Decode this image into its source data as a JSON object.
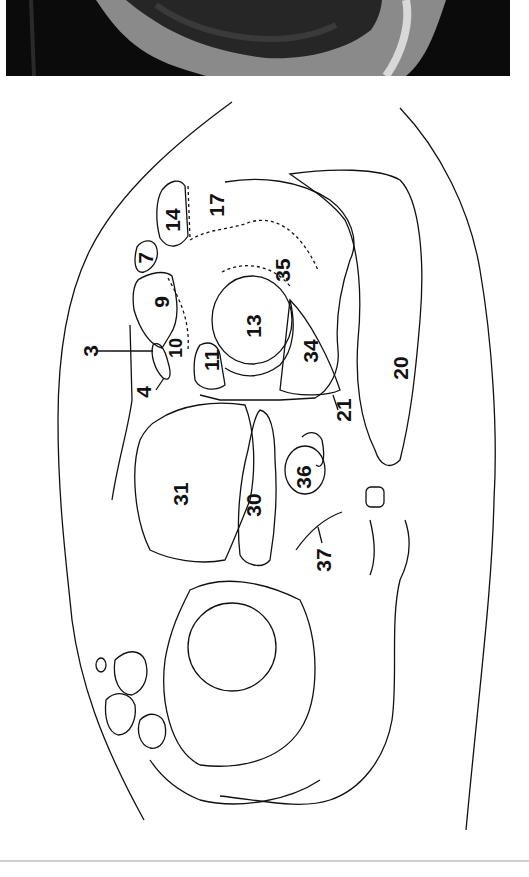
{
  "figure": {
    "type": "cross-sectional anatomy diagram",
    "image_panel": "MRI slice (grayscale)",
    "labels": [
      {
        "id": "3",
        "text": "3"
      },
      {
        "id": "4",
        "text": "4"
      },
      {
        "id": "7",
        "text": "7"
      },
      {
        "id": "9",
        "text": "9"
      },
      {
        "id": "10",
        "text": "10"
      },
      {
        "id": "11",
        "text": "11"
      },
      {
        "id": "13",
        "text": "13"
      },
      {
        "id": "14",
        "text": "14"
      },
      {
        "id": "17",
        "text": "17"
      },
      {
        "id": "20",
        "text": "20"
      },
      {
        "id": "21",
        "text": "21"
      },
      {
        "id": "30",
        "text": "30"
      },
      {
        "id": "31",
        "text": "31"
      },
      {
        "id": "34",
        "text": "34"
      },
      {
        "id": "35",
        "text": "35"
      },
      {
        "id": "36",
        "text": "36"
      },
      {
        "id": "37",
        "text": "37"
      }
    ]
  },
  "colors": {
    "line": "#111111",
    "mri_dark": "#0a0a0a",
    "mri_mid": "#6e6e6e",
    "mri_light": "#b8b8b8",
    "divider": "#cfcfcf"
  }
}
